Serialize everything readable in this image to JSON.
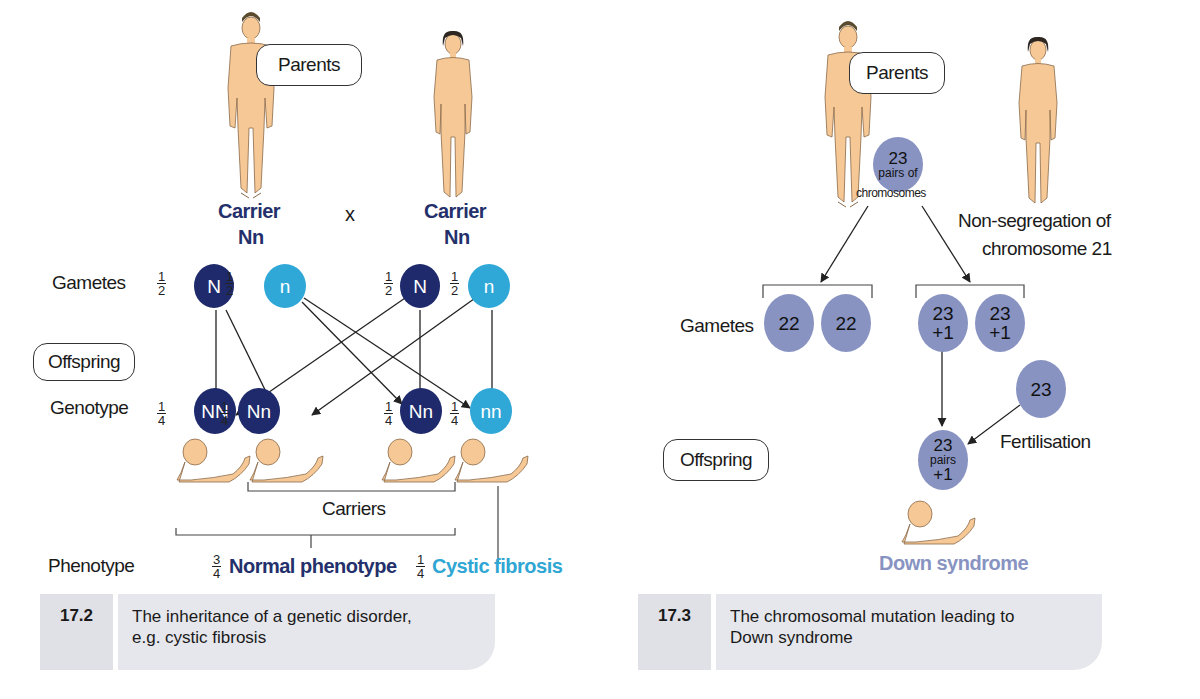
{
  "colors": {
    "dominant_allele": "#1e2a6b",
    "recessive_allele": "#2fa8d8",
    "chromosome_circle": "#8893c2",
    "caption_bg": "#e6e7ec",
    "skin": "#f5c896"
  },
  "left_figure": {
    "parents_label": "Parents",
    "cross_symbol": "x",
    "father": {
      "status": "Carrier",
      "genotype": "Nn"
    },
    "mother": {
      "status": "Carrier",
      "genotype": "Nn"
    },
    "gametes_label": "Gametes",
    "gametes": [
      {
        "allele": "N",
        "fraction_num": "1",
        "fraction_den": "2",
        "type": "dominant"
      },
      {
        "allele": "n",
        "fraction_num": "1",
        "fraction_den": "2",
        "type": "recessive"
      },
      {
        "allele": "N",
        "fraction_num": "1",
        "fraction_den": "2",
        "type": "dominant"
      },
      {
        "allele": "n",
        "fraction_num": "1",
        "fraction_den": "2",
        "type": "recessive"
      }
    ],
    "offspring_label": "Offspring",
    "genotype_label": "Genotype",
    "genotypes": [
      {
        "value": "NN",
        "fraction_num": "1",
        "fraction_den": "4",
        "type": "dominant"
      },
      {
        "value": "Nn",
        "fraction_num": "1",
        "fraction_den": "4",
        "type": "dominant"
      },
      {
        "value": "Nn",
        "fraction_num": "1",
        "fraction_den": "4",
        "type": "dominant"
      },
      {
        "value": "nn",
        "fraction_num": "1",
        "fraction_den": "4",
        "type": "recessive"
      }
    ],
    "carriers_label": "Carriers",
    "phenotype_label": "Phenotype",
    "normal": {
      "fraction_num": "3",
      "fraction_den": "4",
      "label": "Normal phenotype"
    },
    "affected": {
      "fraction_num": "1",
      "fraction_den": "4",
      "label": "Cystic fibrosis"
    },
    "caption": {
      "number": "17.2",
      "line1": "The inheritance of a genetic disorder,",
      "line2": "e.g. cystic fibrosis"
    }
  },
  "right_figure": {
    "parents_label": "Parents",
    "parent_cell": {
      "number": "23",
      "line2": "pairs of",
      "line3": "chromosomes"
    },
    "non_segregation_line1": "Non-segregation of",
    "non_segregation_line2": "chromosome 21",
    "gametes_label": "Gametes",
    "gametes": [
      {
        "line1": "22",
        "line2": ""
      },
      {
        "line1": "22",
        "line2": ""
      },
      {
        "line1": "23",
        "line2": "+1"
      },
      {
        "line1": "23",
        "line2": "+1"
      }
    ],
    "normal_gamete": "23",
    "fertilisation_label": "Fertilisation",
    "offspring_label": "Offspring",
    "zygote": {
      "line1": "23",
      "line2": "pairs",
      "line3": "+1"
    },
    "result_label": "Down syndrome",
    "caption": {
      "number": "17.3",
      "line1": "The chromosomal mutation leading to",
      "line2": "Down syndrome"
    }
  }
}
